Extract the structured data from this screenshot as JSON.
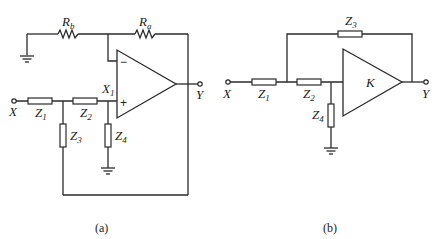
{
  "figure_a": {
    "caption": "(a)",
    "labels": {
      "Rb": {
        "main": "R",
        "sub": "b"
      },
      "Ra": {
        "main": "R",
        "sub": "a"
      },
      "X1": {
        "main": "X",
        "sub": "1"
      },
      "Z1": {
        "main": "Z",
        "sub": "1"
      },
      "Z2": {
        "main": "Z",
        "sub": "2"
      },
      "Z3": {
        "main": "Z",
        "sub": "3"
      },
      "Z4": {
        "main": "Z",
        "sub": "4"
      },
      "X": "X",
      "Y": "Y",
      "minus": "−",
      "plus": "+"
    }
  },
  "figure_b": {
    "caption": "(b)",
    "labels": {
      "Z1": {
        "main": "Z",
        "sub": "1"
      },
      "Z2": {
        "main": "Z",
        "sub": "2"
      },
      "Z3": {
        "main": "Z",
        "sub": "3"
      },
      "Z4": {
        "main": "Z",
        "sub": "4"
      },
      "K": "K",
      "X": "X",
      "Y": "Y"
    }
  },
  "colors": {
    "line": "#2a2a2a",
    "background": "#ffffff"
  }
}
